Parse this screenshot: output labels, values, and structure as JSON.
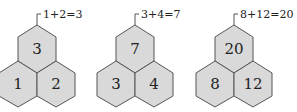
{
  "groups": [
    {
      "top": "3",
      "left": "1",
      "right": "2",
      "equation": "1+2=3"
    },
    {
      "top": "7",
      "left": "3",
      "right": "4",
      "equation": "3+4=7"
    },
    {
      "top": "20",
      "left": "8",
      "right": "12",
      "equation": "8+12=20"
    }
  ],
  "colors": {
    "hex_fill": "#d9d9d9",
    "hex_stroke": "#555555",
    "text": "#222222"
  }
}
